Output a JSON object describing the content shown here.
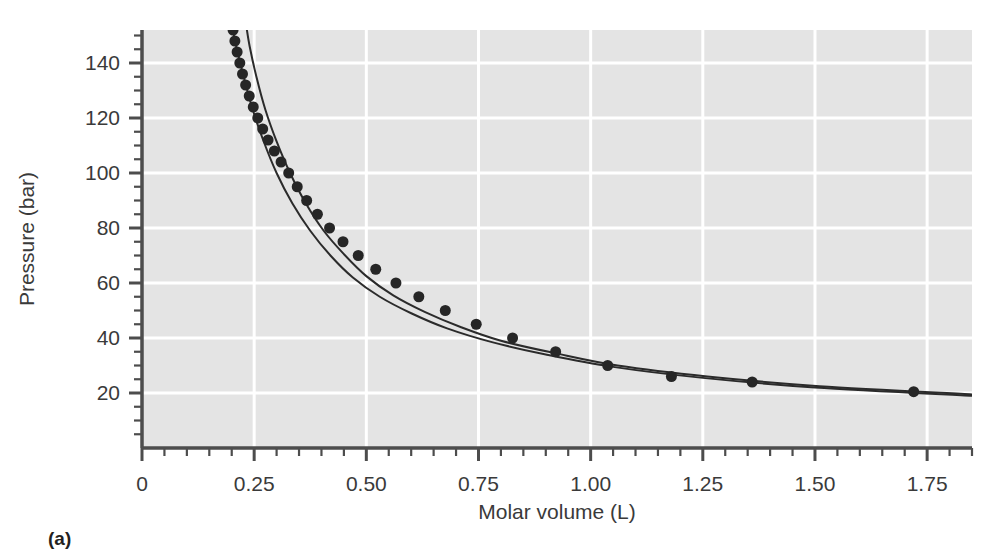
{
  "figure": {
    "panel_label": "(a)",
    "background_color": "#ffffff",
    "plot_background_color": "#e4e4e4",
    "grid_color": "#ffffff",
    "axis_color": "#4d4d4d",
    "marker_color": "#262626",
    "curve_color": "#2b2b2b"
  },
  "chart_data": {
    "type": "scatter",
    "title": "",
    "subtitle": "",
    "xlabel": "Molar volume (L)",
    "ylabel": "Pressure (bar)",
    "xlim": [
      0,
      1.85
    ],
    "ylim": [
      0,
      152
    ],
    "grid": true,
    "legend_position": "none",
    "xticks": [
      0,
      0.25,
      0.5,
      0.75,
      1.0,
      1.25,
      1.5,
      1.75
    ],
    "xtick_labels": [
      "0",
      "0.25",
      "0.50",
      "0.75",
      "1.00",
      "1.25",
      "1.50",
      "1.75"
    ],
    "xminor_step": 0.05,
    "yticks": [
      20,
      40,
      60,
      80,
      100,
      120,
      140
    ],
    "ytick_labels": [
      "20",
      "40",
      "60",
      "80",
      "100",
      "120",
      "140"
    ],
    "yminor_step": 5,
    "series": [
      {
        "name": "Experimental data",
        "style": "markers",
        "marker": "filled-circle",
        "marker_size": 8,
        "color": "#262626",
        "x": [
          0.203,
          0.207,
          0.212,
          0.218,
          0.224,
          0.231,
          0.239,
          0.248,
          0.258,
          0.269,
          0.281,
          0.295,
          0.31,
          0.327,
          0.346,
          0.367,
          0.391,
          0.418,
          0.448,
          0.482,
          0.521,
          0.566,
          0.617,
          0.676,
          0.745,
          0.826,
          0.922,
          1.038,
          1.18,
          1.36,
          1.72
        ],
        "y": [
          152,
          148,
          144,
          140,
          136,
          132,
          128,
          124,
          120,
          116,
          112,
          108,
          104,
          100,
          95,
          90,
          85,
          80,
          75,
          70,
          65,
          60,
          55,
          50,
          45,
          40,
          35,
          30,
          26,
          24,
          20.5
        ]
      },
      {
        "name": "Equation of state curve A",
        "style": "line",
        "color": "#2b2b2b",
        "line_width": 2,
        "note": "curve passing through the data points",
        "x": [
          0.2,
          0.21,
          0.225,
          0.245,
          0.27,
          0.3,
          0.335,
          0.375,
          0.42,
          0.47,
          0.53,
          0.6,
          0.68,
          0.78,
          0.9,
          1.05,
          1.25,
          1.5,
          1.85
        ],
        "y": [
          154,
          146,
          136,
          124,
          112,
          100,
          89,
          79,
          70,
          62,
          55,
          49,
          43.5,
          38.5,
          34,
          29.5,
          25.5,
          22,
          19
        ]
      },
      {
        "name": "Equation of state curve B",
        "style": "line",
        "color": "#2b2b2b",
        "line_width": 2,
        "note": "curve offset to the right at high pressure, converging near 0.75 L",
        "x": [
          0.232,
          0.24,
          0.255,
          0.275,
          0.3,
          0.33,
          0.365,
          0.405,
          0.45,
          0.5,
          0.56,
          0.63,
          0.71,
          0.8,
          0.92,
          1.06,
          1.26,
          1.51,
          1.85
        ],
        "y": [
          154,
          146,
          135,
          123,
          111.5,
          100,
          89,
          79,
          70.5,
          62.5,
          55.5,
          49.5,
          44,
          39,
          34.5,
          30,
          26,
          22.5,
          19.5
        ]
      }
    ]
  }
}
